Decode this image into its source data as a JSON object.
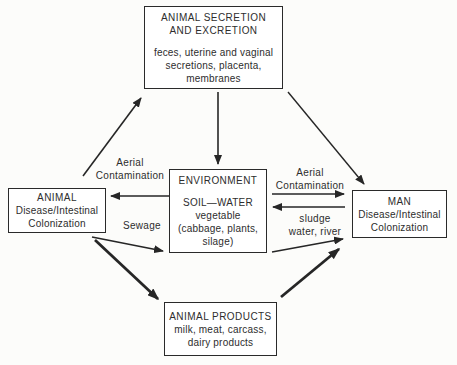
{
  "figure": {
    "background": "#fcfcfa",
    "line_color": "#262626",
    "type": "flow-diagram"
  },
  "boxes": {
    "secretion": {
      "title_lines": [
        "ANIMAL SECRETION",
        "AND EXCRETION"
      ],
      "body_lines": [
        "feces, uterine and vaginal",
        "secretions, placenta,",
        "membranes"
      ]
    },
    "animal": {
      "title_lines": [
        "ANIMAL"
      ],
      "body_lines": [
        "Disease/Intestinal",
        "Colonization"
      ]
    },
    "environment": {
      "title_lines": [
        "ENVIRONMENT"
      ],
      "body_lines": [
        "SOIL—WATER",
        "vegetable",
        "(cabbage, plants,",
        "silage)"
      ]
    },
    "man": {
      "title_lines": [
        "MAN"
      ],
      "body_lines": [
        "Disease/Intestinal",
        "Colonization"
      ]
    },
    "products": {
      "title_lines": [
        "ANIMAL PRODUCTS"
      ],
      "body_lines": [
        "milk, meat, carcass,",
        "dairy products"
      ]
    }
  },
  "labels": {
    "aerial_left": {
      "lines": [
        "Aerial",
        "Contamination"
      ]
    },
    "aerial_right": {
      "lines": [
        "Aerial",
        "Contamination"
      ]
    },
    "sewage": {
      "lines": [
        "Sewage"
      ]
    },
    "sludge": {
      "lines": [
        "sludge",
        "water, river"
      ]
    }
  },
  "edges": [
    {
      "from": "animal",
      "to": "secretion",
      "label": ""
    },
    {
      "from": "secretion",
      "to": "environment",
      "label": ""
    },
    {
      "from": "secretion",
      "to": "man",
      "label": ""
    },
    {
      "from": "environment",
      "to": "animal",
      "label": "Aerial Contamination"
    },
    {
      "from": "environment",
      "to": "man",
      "label": "Aerial Contamination"
    },
    {
      "from": "man",
      "to": "environment",
      "label": "sludge water, river"
    },
    {
      "from": "animal",
      "to": "environment",
      "label": "Sewage"
    },
    {
      "from": "animal",
      "to": "products",
      "label": ""
    },
    {
      "from": "environment",
      "to": "man",
      "label": ""
    },
    {
      "from": "products",
      "to": "man",
      "label": ""
    }
  ]
}
